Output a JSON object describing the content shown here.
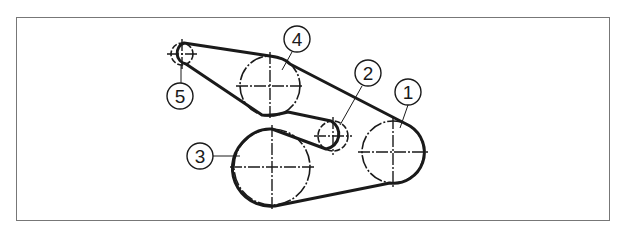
{
  "diagram": {
    "type": "belt-routing",
    "stroke_color": "#1a1a1a",
    "frame_color": "#777777",
    "pulleys": [
      {
        "id": "1",
        "cx": 393,
        "cy": 152,
        "r": 31,
        "label": "1",
        "label_cx": 408,
        "label_cy": 92
      },
      {
        "id": "2",
        "cx": 333,
        "cy": 136,
        "r": 15,
        "label": "2",
        "label_cx": 368,
        "label_cy": 73
      },
      {
        "id": "3",
        "cx": 272,
        "cy": 167,
        "r": 38,
        "label": "3",
        "label_cx": 200,
        "label_cy": 156
      },
      {
        "id": "4",
        "cx": 270,
        "cy": 86,
        "r": 30,
        "label": "4",
        "label_cx": 297,
        "label_cy": 39
      },
      {
        "id": "5",
        "cx": 182,
        "cy": 54,
        "r": 11,
        "label": "5",
        "label_cx": 180,
        "label_cy": 96
      }
    ]
  }
}
